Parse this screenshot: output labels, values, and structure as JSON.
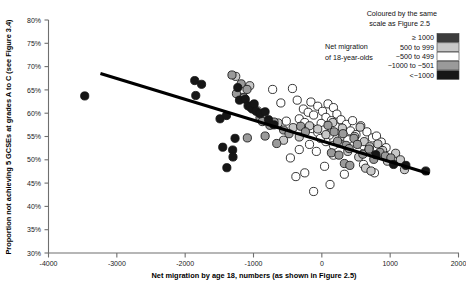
{
  "chart_data": {
    "type": "scatter",
    "title": "",
    "xlabel": "Net migration by age 18, numbers (as shown in Figure 2.5)",
    "ylabel": "Proportion not achieving 5 GCSEs at grades A to C (see Figure 3.4)",
    "xlim": [
      -4000,
      2000
    ],
    "ylim": [
      30,
      80
    ],
    "xticks": [
      -4000,
      -3000,
      -2000,
      -1000,
      0,
      1000,
      2000
    ],
    "xtick_labels": [
      "-4000",
      "-3000",
      "-2000",
      "-1000",
      "0",
      "1000",
      "2000"
    ],
    "yticks": [
      30,
      35,
      40,
      45,
      50,
      55,
      60,
      65,
      70,
      75,
      80
    ],
    "ytick_labels": [
      "30%",
      "35%",
      "40%",
      "45%",
      "50%",
      "55%",
      "60%",
      "65%",
      "70%",
      "75%",
      "80%"
    ],
    "grid": false,
    "legend_position": "top-right",
    "point_radius": 4.1,
    "trendline": {
      "name": "linear fit",
      "x_start": -3240,
      "y_start": 68.5,
      "x_end": 1575,
      "y_end": 47.0,
      "color": "#000000",
      "width": 3.1
    },
    "categories": [
      {
        "key": "ge_1000",
        "label": "≥ 1000",
        "color": "#3c3c3c"
      },
      {
        "key": "500_to_999",
        "label": "500 to 999",
        "color": "#c8c8c8"
      },
      {
        "key": "m500_to_499",
        "label": "−500 to 499",
        "color": "#ffffff"
      },
      {
        "key": "m1000_to_m501",
        "label": "−1000 to −501",
        "color": "#9a9a9a"
      },
      {
        "key": "lt_m1000",
        "label": "<−1000",
        "color": "#161616"
      }
    ],
    "series": [
      {
        "name": "<−1000",
        "class": "lt_m1000",
        "color": "#161616",
        "points": [
          [
            -3470,
            63.7
          ],
          [
            -1860,
            67.0
          ],
          [
            -1760,
            66.2
          ],
          [
            -1845,
            63.8
          ],
          [
            -1490,
            58.8
          ],
          [
            -1230,
            65.5
          ],
          [
            -1205,
            62.8
          ],
          [
            -1270,
            54.6
          ],
          [
            -1120,
            63.0
          ],
          [
            -1080,
            61.6
          ],
          [
            -1045,
            61.3
          ],
          [
            -1015,
            60.9
          ],
          [
            -990,
            62.0
          ],
          [
            -960,
            60.4
          ],
          [
            -1395,
            59.5
          ],
          [
            -1450,
            52.7
          ],
          [
            -1305,
            52.1
          ],
          [
            -1300,
            50.6
          ],
          [
            -1390,
            48.3
          ],
          [
            -905,
            59.9
          ],
          [
            -830,
            60.3
          ],
          [
            -780,
            58.6
          ],
          [
            -700,
            57.5
          ],
          [
            790,
            51.1
          ],
          [
            1050,
            49.0
          ],
          [
            1230,
            48.8
          ],
          [
            1520,
            47.6
          ]
        ]
      },
      {
        "name": "−1000 to −501",
        "class": "m1000_to_m501",
        "color": "#9a9a9a",
        "points": [
          [
            -1315,
            68.2
          ],
          [
            -1180,
            66.3
          ],
          [
            -1250,
            64.2
          ],
          [
            -1095,
            65.1
          ],
          [
            -1140,
            63.3
          ],
          [
            -1020,
            61.0
          ],
          [
            -905,
            59.0
          ],
          [
            -870,
            58.2
          ],
          [
            -760,
            57.4
          ],
          [
            -700,
            58.1
          ],
          [
            -830,
            55.1
          ],
          [
            -1090,
            54.7
          ],
          [
            -660,
            53.5
          ],
          [
            -560,
            56.4
          ],
          [
            -480,
            55.6
          ],
          [
            -310,
            57.2
          ],
          [
            -240,
            56.0
          ],
          [
            90,
            57.4
          ],
          [
            180,
            56.0
          ],
          [
            230,
            54.0
          ],
          [
            310,
            55.6
          ],
          [
            355,
            53.1
          ],
          [
            400,
            52.4
          ],
          [
            140,
            51.5
          ],
          [
            250,
            51.0
          ],
          [
            470,
            54.6
          ],
          [
            520,
            53.3
          ],
          [
            600,
            51.2
          ],
          [
            690,
            52.3
          ],
          [
            760,
            50.1
          ],
          [
            330,
            49.2
          ],
          [
            410,
            48.8
          ],
          [
            850,
            51.6
          ],
          [
            930,
            50.8
          ],
          [
            1010,
            50.4
          ]
        ]
      },
      {
        "name": "500 to 999",
        "class": "500_to_999",
        "color": "#c8c8c8",
        "points": [
          [
            -1260,
            67.9
          ],
          [
            -1055,
            65.9
          ],
          [
            -1170,
            63.4
          ],
          [
            -940,
            60.5
          ],
          [
            -640,
            57.9
          ],
          [
            -560,
            54.2
          ],
          [
            -420,
            56.9
          ],
          [
            -330,
            54.9
          ],
          [
            -180,
            57.3
          ],
          [
            -60,
            56.6
          ],
          [
            60,
            55.4
          ],
          [
            160,
            58.0
          ],
          [
            300,
            56.8
          ],
          [
            480,
            55.0
          ],
          [
            560,
            57.0
          ],
          [
            620,
            53.9
          ],
          [
            700,
            52.8
          ],
          [
            380,
            51.8
          ],
          [
            540,
            50.6
          ],
          [
            820,
            53.4
          ],
          [
            890,
            52.0
          ],
          [
            960,
            49.7
          ],
          [
            1080,
            51.4
          ],
          [
            1150,
            50.0
          ],
          [
            1210,
            47.9
          ],
          [
            640,
            48.2
          ],
          [
            720,
            47.6
          ]
        ]
      },
      {
        "name": "−500 to 499",
        "class": "m500_to_499",
        "color": "#ffffff",
        "points": [
          [
            -430,
            65.3
          ],
          [
            -360,
            62.8
          ],
          [
            -160,
            62.4
          ],
          [
            -270,
            60.9
          ],
          [
            -200,
            60.2
          ],
          [
            -120,
            59.6
          ],
          [
            -330,
            58.8
          ],
          [
            -250,
            58.0
          ],
          [
            -60,
            61.5
          ],
          [
            10,
            60.4
          ],
          [
            90,
            62.0
          ],
          [
            170,
            61.2
          ],
          [
            60,
            59.1
          ],
          [
            140,
            58.4
          ],
          [
            220,
            59.8
          ],
          [
            -10,
            57.8
          ],
          [
            -140,
            56.7
          ],
          [
            -60,
            55.9
          ],
          [
            30,
            56.4
          ],
          [
            110,
            55.3
          ],
          [
            200,
            57.1
          ],
          [
            280,
            58.6
          ],
          [
            360,
            57.6
          ],
          [
            450,
            58.4
          ],
          [
            300,
            55.1
          ],
          [
            380,
            54.3
          ],
          [
            250,
            53.6
          ],
          [
            170,
            53.1
          ],
          [
            60,
            53.9
          ],
          [
            -20,
            54.6
          ],
          [
            -180,
            53.3
          ],
          [
            -330,
            52.2
          ],
          [
            -80,
            51.8
          ],
          [
            170,
            51.0
          ],
          [
            420,
            56.2
          ],
          [
            500,
            55.4
          ],
          [
            570,
            57.3
          ],
          [
            660,
            56.0
          ],
          [
            740,
            54.7
          ],
          [
            610,
            53.0
          ],
          [
            690,
            52.1
          ],
          [
            800,
            55.1
          ],
          [
            870,
            53.8
          ],
          [
            940,
            52.6
          ],
          [
            -460,
            50.4
          ],
          [
            -250,
            47.2
          ],
          [
            40,
            48.6
          ],
          [
            330,
            46.9
          ],
          [
            120,
            44.7
          ],
          [
            -120,
            43.2
          ],
          [
            -720,
            65.1
          ],
          [
            610,
            49.0
          ],
          [
            -520,
            58.3
          ],
          [
            -600,
            62.2
          ],
          [
            770,
            47.2
          ],
          [
            -380,
            46.4
          ]
        ]
      }
    ]
  },
  "legend": {
    "headline_line1": "Coloured by the same",
    "headline_line2": "scale as Figure 2.5",
    "title_line1": "Net migration",
    "title_line2": "of 18-year-olds"
  },
  "axes": {
    "x_title": "Net migration by age 18, numbers (as shown in Figure 2.5)",
    "y_title": "Proportion not achieving 5 GCSEs at grades A to C (see Figure 3.4)"
  }
}
